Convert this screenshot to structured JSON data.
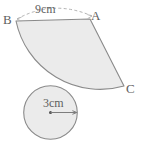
{
  "figure": {
    "background_color": "#ffffff",
    "fill_color": "#ebebeb",
    "stroke_color": "#8a8a8a",
    "dashed_stroke_color": "#b0b0b0",
    "text_color": "#5e5e5e",
    "sector": {
      "name": "shaded-sector",
      "vertices": {
        "B": {
          "label": "B",
          "x": 16,
          "y": 21
        },
        "A": {
          "label": "A",
          "x": 90,
          "y": 19
        },
        "C": {
          "label": "C",
          "x": 124,
          "y": 86
        }
      },
      "arc_label": {
        "text": "9cm",
        "value": 9,
        "unit": "cm",
        "style": "dashed-arc-with-arrowheads"
      }
    },
    "circle": {
      "name": "shaded-circle",
      "center": {
        "x": 50.5,
        "y": 112.5
      },
      "radius": 27,
      "radius_label": {
        "text": "3cm",
        "value": 3,
        "unit": "cm"
      }
    }
  }
}
